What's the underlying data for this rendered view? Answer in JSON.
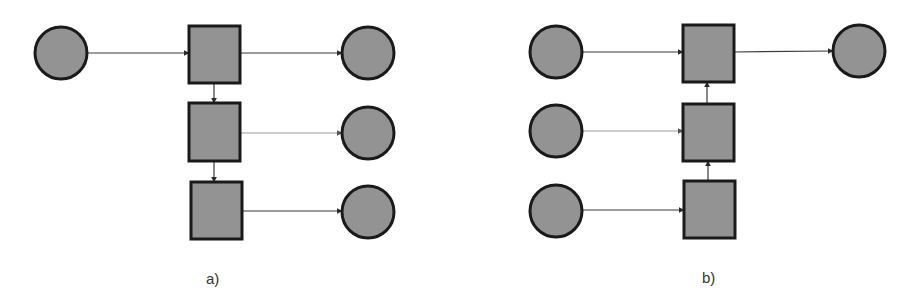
{
  "colors": {
    "node_fill": "#939393",
    "node_stroke": "#1a1a1a",
    "edge": "#3a3a3a",
    "edge_faint": "#9a9a9a",
    "background": "#ffffff"
  },
  "panels": [
    {
      "id": "a",
      "caption": "a)",
      "caption_pos": {
        "x": 206,
        "y": 270
      },
      "nodes": [
        {
          "id": "a-in",
          "shape": "circle",
          "cx": 61,
          "cy": 53,
          "r": 26
        },
        {
          "id": "a-sq1",
          "shape": "square",
          "x": 189,
          "y": 26,
          "w": 51,
          "h": 57
        },
        {
          "id": "a-sq2",
          "shape": "square",
          "x": 189,
          "y": 103,
          "w": 51,
          "h": 58
        },
        {
          "id": "a-sq3",
          "shape": "square",
          "x": 191,
          "y": 182,
          "w": 51,
          "h": 57
        },
        {
          "id": "a-out1",
          "shape": "circle",
          "cx": 368,
          "cy": 53,
          "r": 26
        },
        {
          "id": "a-out2",
          "shape": "circle",
          "cx": 368,
          "cy": 133,
          "r": 26
        },
        {
          "id": "a-out3",
          "shape": "circle",
          "cx": 368,
          "cy": 212,
          "r": 26
        }
      ],
      "edges": [
        {
          "from": "a-in",
          "to": "a-sq1",
          "x1": 87,
          "y1": 53,
          "x2": 189,
          "y2": 53,
          "faint": false
        },
        {
          "from": "a-sq1",
          "to": "a-out1",
          "x1": 240,
          "y1": 53,
          "x2": 342,
          "y2": 53,
          "faint": false
        },
        {
          "from": "a-sq1",
          "to": "a-sq2",
          "x1": 214,
          "y1": 83,
          "x2": 214,
          "y2": 103,
          "faint": false
        },
        {
          "from": "a-sq2",
          "to": "a-out2",
          "x1": 240,
          "y1": 133,
          "x2": 342,
          "y2": 133,
          "faint": true
        },
        {
          "from": "a-sq2",
          "to": "a-sq3",
          "x1": 214,
          "y1": 161,
          "x2": 214,
          "y2": 182,
          "faint": false
        },
        {
          "from": "a-sq3",
          "to": "a-out3",
          "x1": 242,
          "y1": 211,
          "x2": 342,
          "y2": 211,
          "faint": false
        }
      ]
    },
    {
      "id": "b",
      "caption": "b)",
      "caption_pos": {
        "x": 702,
        "y": 269
      },
      "nodes": [
        {
          "id": "b-in1",
          "shape": "circle",
          "cx": 556,
          "cy": 52,
          "r": 26
        },
        {
          "id": "b-in2",
          "shape": "circle",
          "cx": 556,
          "cy": 131,
          "r": 26
        },
        {
          "id": "b-in3",
          "shape": "circle",
          "cx": 556,
          "cy": 211,
          "r": 26
        },
        {
          "id": "b-sq1",
          "shape": "square",
          "x": 683,
          "y": 25,
          "w": 51,
          "h": 57
        },
        {
          "id": "b-sq2",
          "shape": "square",
          "x": 683,
          "y": 104,
          "w": 51,
          "h": 57
        },
        {
          "id": "b-sq3",
          "shape": "square",
          "x": 684,
          "y": 181,
          "w": 51,
          "h": 57
        },
        {
          "id": "b-out",
          "shape": "circle",
          "cx": 859,
          "cy": 51,
          "r": 26
        }
      ],
      "edges": [
        {
          "from": "b-in1",
          "to": "b-sq1",
          "x1": 582,
          "y1": 52,
          "x2": 683,
          "y2": 52,
          "faint": false
        },
        {
          "from": "b-sq1",
          "to": "b-out",
          "x1": 734,
          "y1": 52,
          "x2": 833,
          "y2": 51,
          "faint": false
        },
        {
          "from": "b-in2",
          "to": "b-sq2",
          "x1": 582,
          "y1": 131,
          "x2": 683,
          "y2": 131,
          "faint": true
        },
        {
          "from": "b-in3",
          "to": "b-sq3",
          "x1": 582,
          "y1": 210,
          "x2": 684,
          "y2": 210,
          "faint": false
        },
        {
          "from": "b-sq2",
          "to": "b-sq1",
          "x1": 707,
          "y1": 104,
          "x2": 707,
          "y2": 82,
          "faint": false
        },
        {
          "from": "b-sq3",
          "to": "b-sq2",
          "x1": 708,
          "y1": 181,
          "x2": 708,
          "y2": 161,
          "faint": false
        }
      ]
    }
  ]
}
